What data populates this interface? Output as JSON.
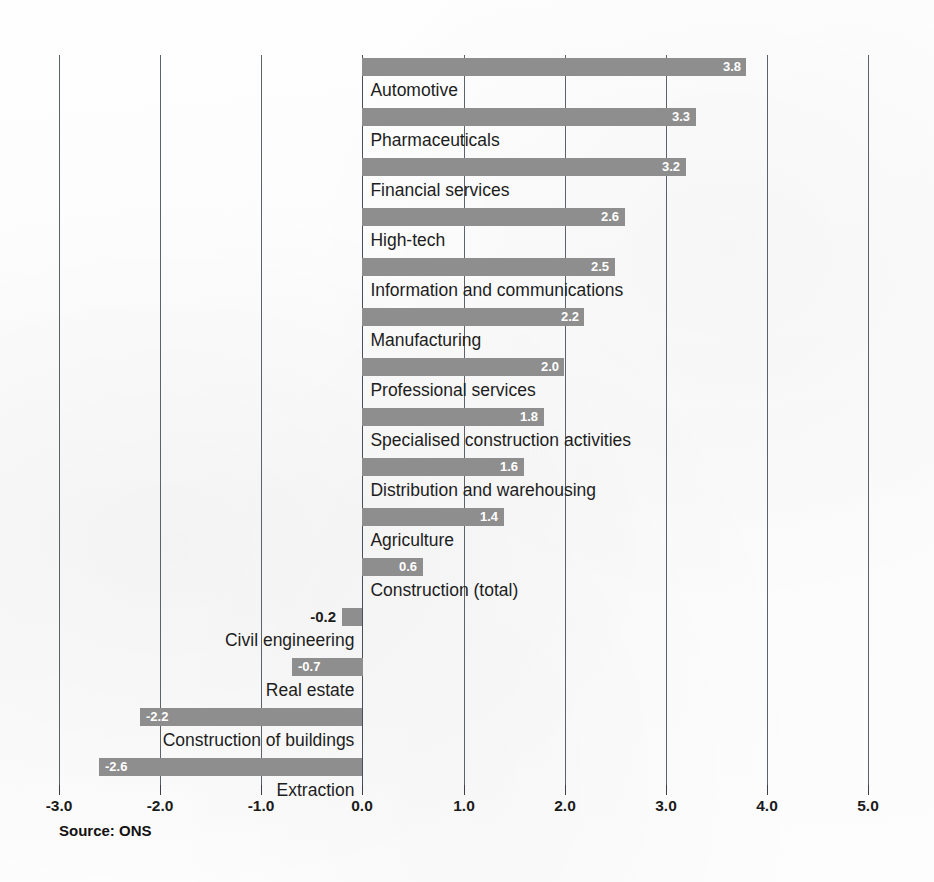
{
  "chart_data": {
    "type": "bar",
    "orientation": "horizontal",
    "title": "",
    "subtitle": "",
    "xlabel": "",
    "ylabel": "",
    "xlim": [
      -3.0,
      5.0
    ],
    "xticks": [
      "-3.0",
      "-2.0",
      "-1.0",
      "0.0",
      "1.0",
      "2.0",
      "3.0",
      "4.0",
      "5.0"
    ],
    "xtick_values": [
      -3.0,
      -2.0,
      -1.0,
      0.0,
      1.0,
      2.0,
      3.0,
      4.0,
      5.0
    ],
    "grid": "vertical",
    "legend": "none",
    "bar_color": "#8e8e8e",
    "categories": [
      "Automotive",
      "Pharmaceuticals",
      "Financial services",
      "High-tech",
      "Information and communications",
      "Manufacturing",
      "Professional services",
      "Specialised construction activities",
      "Distribution and warehousing",
      "Agriculture",
      "Construction (total)",
      "Civil engineering",
      "Real estate",
      "Construction of buildings",
      "Extraction"
    ],
    "values": [
      3.8,
      3.3,
      3.2,
      2.6,
      2.5,
      2.2,
      2.0,
      1.8,
      1.6,
      1.4,
      0.6,
      -0.2,
      -0.7,
      -2.2,
      -2.6
    ],
    "value_labels": [
      "3.8",
      "3.3",
      "3.2",
      "2.6",
      "2.5",
      "2.2",
      "2.0",
      "1.8",
      "1.6",
      "1.4",
      "0.6",
      "-0.2",
      "-0.7",
      "-2.2",
      "-2.6"
    ]
  },
  "source": {
    "note": "Source: ONS"
  }
}
